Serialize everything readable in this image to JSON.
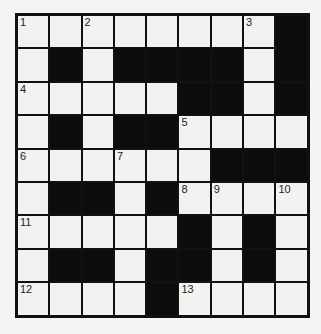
{
  "puzzle": {
    "rows": 9,
    "cols": 9,
    "colors": {
      "white": "#f2f2f0",
      "black": "#0c0c0c",
      "line": "#111111"
    },
    "layout": [
      [
        0,
        0,
        0,
        0,
        0,
        0,
        0,
        0,
        1
      ],
      [
        0,
        1,
        0,
        1,
        1,
        1,
        1,
        0,
        1
      ],
      [
        0,
        0,
        0,
        0,
        0,
        1,
        1,
        0,
        1
      ],
      [
        0,
        1,
        0,
        1,
        1,
        0,
        0,
        0,
        0
      ],
      [
        0,
        0,
        0,
        0,
        0,
        0,
        1,
        1,
        1
      ],
      [
        0,
        1,
        1,
        0,
        1,
        0,
        0,
        0,
        0
      ],
      [
        0,
        0,
        0,
        0,
        0,
        1,
        0,
        1,
        0
      ],
      [
        0,
        1,
        1,
        0,
        1,
        1,
        0,
        1,
        0
      ],
      [
        0,
        0,
        0,
        0,
        1,
        0,
        0,
        0,
        0
      ]
    ],
    "numbers": [
      {
        "r": 0,
        "c": 0,
        "n": "1"
      },
      {
        "r": 0,
        "c": 2,
        "n": "2"
      },
      {
        "r": 0,
        "c": 7,
        "n": "3"
      },
      {
        "r": 2,
        "c": 0,
        "n": "4"
      },
      {
        "r": 3,
        "c": 5,
        "n": "5"
      },
      {
        "r": 4,
        "c": 0,
        "n": "6"
      },
      {
        "r": 4,
        "c": 3,
        "n": "7"
      },
      {
        "r": 5,
        "c": 5,
        "n": "8"
      },
      {
        "r": 5,
        "c": 6,
        "n": "9"
      },
      {
        "r": 5,
        "c": 8,
        "n": "10"
      },
      {
        "r": 6,
        "c": 0,
        "n": "11"
      },
      {
        "r": 8,
        "c": 0,
        "n": "12"
      },
      {
        "r": 8,
        "c": 5,
        "n": "13"
      }
    ]
  }
}
